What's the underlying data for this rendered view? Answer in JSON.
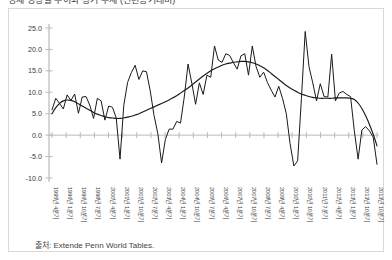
{
  "title_clipped": "경제 성장률 추이와 장기 추세 (전년동기대비)",
  "source": {
    "label": "출처",
    "text": "출처: Extende Penn World Tables."
  },
  "chart_data": {
    "type": "line",
    "title": "",
    "xlabel": "",
    "ylabel": "",
    "ylim": [
      -10.0,
      25.0
    ],
    "grid": false,
    "legend": "none",
    "ytick_labels": [
      "25.0",
      "20.0",
      "15.0",
      "10.0",
      "5.0",
      "0.0",
      "-5.0",
      "-10.0"
    ],
    "ytick_values": [
      25.0,
      20.0,
      15.0,
      10.0,
      5.0,
      0.0,
      -5.0,
      -10.0
    ],
    "zero_line": 0.0,
    "xtick_labels": [
      "1995년 4분기",
      "1996년 1분기",
      "1996년 10분기",
      "1998년 7분기",
      "2000년 4분기",
      "2001년 1분기",
      "2001년 10분기",
      "2002년 7분기",
      "2003년 4분기",
      "2004년 1분기",
      "2004년 10분기",
      "2005년 7분기",
      "2006년 4분기",
      "2007년 1분기",
      "2007년 10분기",
      "2008년 7분기",
      "2009년 4분기",
      "2010년 1분기",
      "2010년 10분기",
      "2011년 7분기",
      "2012년 4분기",
      "2013년 1분기",
      "2013년 10분기",
      "2013년 10분기"
    ],
    "series": [
      {
        "name": "분기 성장률",
        "style": "jagged",
        "color": "#1a1a1a",
        "values": [
          5.9,
          8.6,
          7.4,
          6.1,
          9.4,
          8.1,
          9.6,
          5.1,
          8.9,
          9.0,
          7.0,
          3.9,
          8.6,
          8.0,
          3.5,
          6.8,
          6.5,
          4.0,
          -5.6,
          7.0,
          12.3,
          14.6,
          16.3,
          13.0,
          15.0,
          14.8,
          10.3,
          4.6,
          0.4,
          -6.5,
          -1.0,
          1.4,
          1.4,
          3.2,
          2.8,
          8.9,
          16.6,
          12.1,
          7.2,
          12.2,
          9.5,
          14.0,
          13.5,
          20.8,
          17.5,
          17.0,
          19.0,
          18.6,
          16.9,
          15.4,
          18.5,
          19.0,
          14.0,
          20.8,
          16.0,
          13.5,
          14.7,
          12.3,
          10.5,
          8.9,
          11.4,
          8.6,
          5.0,
          -2.0,
          -7.2,
          -6.0,
          8.5,
          24.2,
          16.0,
          12.2,
          8.0,
          12.0,
          9.0,
          8.9,
          18.9,
          8.0,
          9.8,
          10.2,
          9.5,
          9.0,
          1.0,
          -5.6,
          1.2,
          2.0,
          1.0,
          -0.5,
          -6.8
        ]
      },
      {
        "name": "장기 추세",
        "style": "smooth",
        "color": "#1a1a1a",
        "values": [
          5.0,
          6.4,
          7.4,
          8.0,
          8.2,
          8.1,
          7.8,
          7.3,
          6.8,
          6.3,
          5.8,
          5.3,
          4.9,
          4.6,
          4.3,
          4.1,
          4.0,
          3.9,
          3.9,
          4.0,
          4.2,
          4.4,
          4.7,
          5.0,
          5.4,
          5.8,
          6.2,
          6.6,
          7.0,
          7.4,
          7.8,
          8.2,
          8.7,
          9.2,
          9.8,
          10.4,
          11.0,
          11.7,
          12.4,
          13.1,
          13.8,
          14.4,
          15.0,
          15.5,
          15.9,
          16.3,
          16.6,
          16.8,
          17.0,
          17.1,
          17.2,
          17.2,
          17.1,
          16.9,
          16.6,
          16.2,
          15.7,
          15.1,
          14.4,
          13.7,
          13.0,
          12.3,
          11.6,
          11.0,
          10.5,
          10.0,
          9.6,
          9.3,
          9.0,
          8.8,
          8.7,
          8.6,
          8.6,
          8.6,
          8.6,
          8.7,
          8.7,
          8.7,
          8.7,
          8.6,
          8.3,
          7.5,
          6.2,
          4.5,
          2.5,
          0.2,
          -2.5
        ]
      }
    ]
  }
}
